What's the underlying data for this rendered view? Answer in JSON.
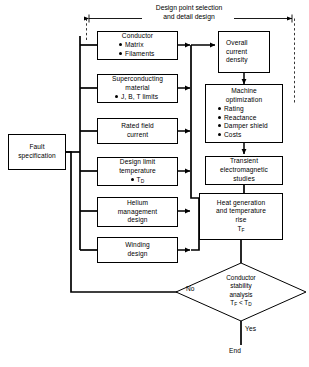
{
  "diagram": {
    "title_line1": "Design point selection",
    "title_line2": "and detail design",
    "start_box": {
      "line1": "Fault",
      "line2": "specification"
    },
    "input_boxes": [
      {
        "name": "conductor",
        "lines": [
          "Conductor"
        ],
        "bullets": [
          "Matrix",
          "Filaments"
        ]
      },
      {
        "name": "superconducting-material",
        "lines": [
          "Superconducting",
          "material"
        ],
        "bullets": [
          "J, B, T limits"
        ]
      },
      {
        "name": "rated-field-current",
        "lines": [
          "Rated field",
          "current"
        ],
        "bullets": []
      },
      {
        "name": "design-limit-temperature",
        "lines": [
          "Design  limit",
          "temperature"
        ],
        "bullets": [
          "TD"
        ]
      },
      {
        "name": "helium-management-design",
        "lines": [
          "Helium",
          "management",
          "design"
        ],
        "bullets": []
      },
      {
        "name": "winding-design",
        "lines": [
          "Winding",
          "design"
        ],
        "bullets": []
      }
    ],
    "overall_current_density": {
      "line1": "Overall",
      "line2": "current",
      "line3": "density"
    },
    "machine_optimization": {
      "line1": "Machine",
      "line2": "optimization",
      "bullets": [
        "Rating",
        "Reactance",
        "Damper shield",
        "Costs"
      ]
    },
    "transient_studies": {
      "line1": "Transient",
      "line2": "electromagnetic",
      "line3": "studies"
    },
    "heat_generation": {
      "line1": "Heat generation",
      "line2": "and temperature",
      "line3": "rise",
      "line4": "TF"
    },
    "decision": {
      "line1": "Conductor",
      "line2": "stability",
      "line3": "analysis",
      "line4": "TF < TD"
    },
    "label_no": "No",
    "label_yes": "Yes",
    "end_label": "End",
    "colors": {
      "line": "#000000",
      "background": "#ffffff"
    }
  }
}
